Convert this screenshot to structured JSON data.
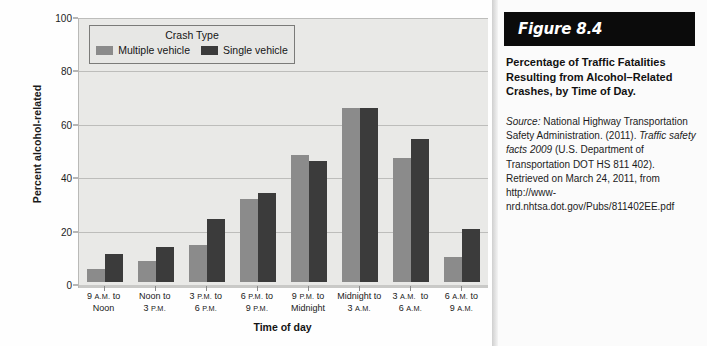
{
  "chart_data": {
    "type": "bar",
    "title": "",
    "xlabel": "Time of day",
    "ylabel": "Percent alcohol-related",
    "ylim": [
      0,
      100
    ],
    "yticks": [
      0,
      20,
      40,
      60,
      80,
      100
    ],
    "grid": true,
    "legend_position": "top-left-inside",
    "legend_title": "Crash Type",
    "categories": [
      "9 A.M. to Noon",
      "Noon to 3 P.M.",
      "3 P.M. to 6 P.M.",
      "6 P.M. to 9 P.M.",
      "9 P.M. to Midnight",
      "Midnight to 3 A.M.",
      "3 A.M. to 6 A.M.",
      "6 A.M. to 9 A.M."
    ],
    "series": [
      {
        "name": "Multiple vehicle",
        "color": "#8b8b8b",
        "values": [
          5,
          8,
          14,
          31,
          47.5,
          65,
          46.5,
          9.5
        ]
      },
      {
        "name": "Single vehicle",
        "color": "#3b3b3b",
        "values": [
          10.5,
          13,
          23.5,
          33.5,
          45.5,
          65,
          53.5,
          20
        ]
      }
    ]
  },
  "chart": {
    "ylabel": "Percent alcohol-related",
    "xlabel": "Time of day",
    "yticks": [
      "0",
      "20",
      "40",
      "60",
      "80",
      "100"
    ],
    "legend": {
      "title": "Crash Type",
      "items": [
        {
          "label": "Multiple vehicle",
          "swatch": "multi"
        },
        {
          "label": "Single vehicle",
          "swatch": "single"
        }
      ]
    },
    "xticks": [
      {
        "line1_num": "9 ",
        "line1_sc": "A.M.",
        "line1_rest": " to",
        "line2_num": "Noon",
        "line2_sc": "",
        "line2_rest": ""
      },
      {
        "line1_num": "Noon",
        "line1_sc": "",
        "line1_rest": " to",
        "line2_num": "3 ",
        "line2_sc": "P.M.",
        "line2_rest": ""
      },
      {
        "line1_num": "3 ",
        "line1_sc": "P.M.",
        "line1_rest": " to",
        "line2_num": "6 ",
        "line2_sc": "P.M.",
        "line2_rest": ""
      },
      {
        "line1_num": "6 ",
        "line1_sc": "P.M.",
        "line1_rest": " to",
        "line2_num": "9 ",
        "line2_sc": "P.M.",
        "line2_rest": ""
      },
      {
        "line1_num": "9 ",
        "line1_sc": "P.M.",
        "line1_rest": " to",
        "line2_num": "Midnight",
        "line2_sc": "",
        "line2_rest": ""
      },
      {
        "line1_num": "Midnight",
        "line1_sc": "",
        "line1_rest": " to",
        "line2_num": "3 ",
        "line2_sc": "A.M.",
        "line2_rest": ""
      },
      {
        "line1_num": "3 ",
        "line1_sc": "A.M.",
        "line1_rest": "  to",
        "line2_num": "6 ",
        "line2_sc": "A.M.",
        "line2_rest": ""
      },
      {
        "line1_num": "6 ",
        "line1_sc": "A.M.",
        "line1_rest": " to",
        "line2_num": "9 ",
        "line2_sc": "A.M.",
        "line2_rest": ""
      }
    ]
  },
  "figure": {
    "number": "Figure 8.4",
    "title": "Percentage of Traffic Fatalities Resulting from Alcohol–Related Crashes, by Time of Day.",
    "source_label": "Source:",
    "source_text_1": " National Highway Transportation Safety Administration. (2011). ",
    "source_italic": "Traffic safety facts 2009",
    "source_text_2": " (U.S. Department of Transportation DOT HS 811 402). Retrieved on March 24, 2011, from http://www-nrd.nhtsa.dot.gov/Pubs/811402EE.pdf"
  },
  "colors": {
    "multiple_vehicle": "#8b8b8b",
    "single_vehicle": "#3b3b3b",
    "plot_background": "#e9e9e7",
    "figure_header_background": "#0b0b0b"
  }
}
